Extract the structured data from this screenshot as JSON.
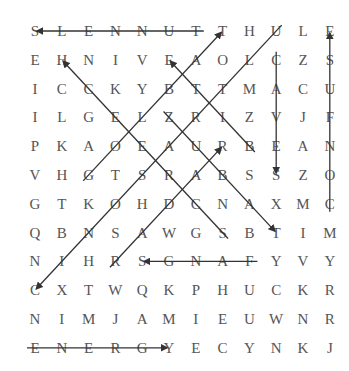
{
  "puzzle": {
    "rows": 12,
    "cols": 12,
    "grid": [
      [
        "S",
        "L",
        "E",
        "N",
        "N",
        "U",
        "T",
        "T",
        "H",
        "U",
        "L",
        "E"
      ],
      [
        "E",
        "H",
        "N",
        "I",
        "V",
        "E",
        "A",
        "O",
        "L",
        "C",
        "Z",
        "S"
      ],
      [
        "I",
        "C",
        "C",
        "K",
        "Y",
        "B",
        "T",
        "T",
        "M",
        "A",
        "C",
        "U"
      ],
      [
        "I",
        "L",
        "G",
        "E",
        "L",
        "Z",
        "R",
        "I",
        "Z",
        "V",
        "J",
        "F"
      ],
      [
        "P",
        "K",
        "A",
        "O",
        "E",
        "A",
        "U",
        "R",
        "B",
        "E",
        "A",
        "N"
      ],
      [
        "V",
        "H",
        "G",
        "T",
        "S",
        "R",
        "A",
        "B",
        "S",
        "S",
        "Z",
        "O"
      ],
      [
        "G",
        "T",
        "K",
        "O",
        "H",
        "D",
        "C",
        "N",
        "A",
        "X",
        "M",
        "C"
      ],
      [
        "Q",
        "B",
        "N",
        "S",
        "A",
        "W",
        "G",
        "S",
        "B",
        "T",
        "I",
        "M"
      ],
      [
        "N",
        "I",
        "H",
        "R",
        "S",
        "G",
        "N",
        "A",
        "F",
        "Y",
        "V",
        "Y"
      ],
      [
        "C",
        "X",
        "T",
        "W",
        "Q",
        "K",
        "P",
        "H",
        "U",
        "C",
        "K",
        "R"
      ],
      [
        "N",
        "I",
        "M",
        "J",
        "A",
        "M",
        "I",
        "E",
        "U",
        "W",
        "N",
        "R"
      ],
      [
        "E",
        "N",
        "E",
        "R",
        "G",
        "Y",
        "E",
        "C",
        "Y",
        "N",
        "K",
        "J"
      ]
    ],
    "found_words": [
      {
        "word": "TUNNELS",
        "from": [
          0,
          6
        ],
        "to": [
          0,
          0
        ]
      },
      {
        "word": "GOLBAT",
        "from": [
          5,
          2
        ],
        "to": [
          0,
          7
        ]
      },
      {
        "word": "ULTRASONIC",
        "from": [
          0,
          9
        ],
        "to": [
          9,
          0
        ]
      },
      {
        "word": "SCREECH",
        "from": [
          7,
          7
        ],
        "to": [
          1,
          1
        ]
      },
      {
        "word": "BITE",
        "from": [
          4,
          8
        ],
        "to": [
          1,
          5
        ]
      },
      {
        "word": "ZUBAT",
        "from": [
          3,
          5
        ],
        "to": [
          7,
          9
        ]
      },
      {
        "word": "CAVES",
        "from": [
          1,
          9
        ],
        "to": [
          5,
          9
        ]
      },
      {
        "word": "CONFUSE",
        "from": [
          6,
          11
        ],
        "to": [
          0,
          11
        ]
      },
      {
        "word": "RADAR",
        "from": [
          8,
          3
        ],
        "to": [
          4,
          7
        ]
      },
      {
        "word": "FANGS",
        "from": [
          8,
          8
        ],
        "to": [
          8,
          4
        ]
      },
      {
        "word": "ENERGY",
        "from": [
          11,
          0
        ],
        "to": [
          11,
          5
        ]
      }
    ],
    "colors": {
      "letter": "#555555",
      "line": "#333333",
      "background": "#ffffff"
    }
  }
}
